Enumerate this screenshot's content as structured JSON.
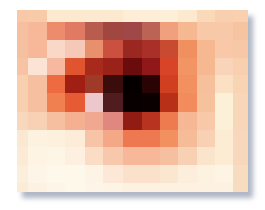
{
  "image": {
    "description": "Pixelated mosaic of an eye on a printed card with drop shadow",
    "grid": {
      "columns": 13,
      "rows": 11
    },
    "shadow_color": "#969eb2",
    "rows": [
      [
        "#f8c8a8",
        "#f7cba8",
        "#fde8d0",
        "#fde8d0",
        "#fde8d0",
        "#fde8d0",
        "#feeed8",
        "#feeed8",
        "#fdefd8",
        "#fde8d0",
        "#f9d9b8",
        "#f8d0b0",
        "#f9d0b0"
      ],
      [
        "#f6c0a0",
        "#f6b898",
        "#ec8c6c",
        "#e07a62",
        "#b85c50",
        "#a04840",
        "#a04848",
        "#bb6455",
        "#f0a07c",
        "#f5b890",
        "#f7c9a8",
        "#f7c9a8",
        "#f6c4a0"
      ],
      [
        "#f5c0a0",
        "#f6b898",
        "#fad8c8",
        "#f6c8b8",
        "#e8906c",
        "#cc5040",
        "#9a2820",
        "#a83028",
        "#c84a30",
        "#f09060",
        "#f5b890",
        "#f8c8a8",
        "#f7c8a8"
      ],
      [
        "#f6c4a4",
        "#fbe4d4",
        "#f7b8a0",
        "#e05530",
        "#a82a1c",
        "#9a2218",
        "#6a0c0c",
        "#901818",
        "#d84428",
        "#f29464",
        "#f6b890",
        "#fad4b8",
        "#f8d0b0"
      ],
      [
        "#f8d0b0",
        "#f6c0a0",
        "#ee6a40",
        "#a01e12",
        "#a03a28",
        "#3a0c0c",
        "#050000",
        "#2a0404",
        "#d04020",
        "#f29060",
        "#f6c09c",
        "#fbe0c4",
        "#f8d4b4"
      ],
      [
        "#f8d0b0",
        "#f6c0a0",
        "#f08050",
        "#e65a34",
        "#ecc8cc",
        "#501c20",
        "#080000",
        "#0a0000",
        "#b83018",
        "#f28c5c",
        "#f6c29e",
        "#fdf0d8",
        "#f8d6b8"
      ],
      [
        "#f8d8bc",
        "#f8d0b4",
        "#f6c0a0",
        "#f4b090",
        "#f0a890",
        "#e08880",
        "#901c14",
        "#b83420",
        "#ee7a50",
        "#f6b894",
        "#f8c8a8",
        "#fdf0d8",
        "#f8d6b8"
      ],
      [
        "#fbe8d0",
        "#fdf2e0",
        "#fdf0dc",
        "#fdecd8",
        "#f8c4a8",
        "#f4a888",
        "#ee7850",
        "#ee7850",
        "#f29060",
        "#f6bc98",
        "#f8d0b4",
        "#fcecd4",
        "#f8d8bc"
      ],
      [
        "#fbead4",
        "#fdf4e4",
        "#fdf6e6",
        "#fdf0e0",
        "#fbdcc4",
        "#f8c8ac",
        "#f6b898",
        "#f6b898",
        "#f6c0a0",
        "#f8d0b4",
        "#fbe4cc",
        "#fcecd4",
        "#f8d8bc"
      ],
      [
        "#fbeedc",
        "#fdf6e8",
        "#fdf8ea",
        "#fdf8ea",
        "#fdf4e6",
        "#fde8d8",
        "#fbe0cc",
        "#fbe0cc",
        "#fbe6d0",
        "#fdeedc",
        "#fdf2e0",
        "#fdf4e4",
        "#f8dcc0"
      ],
      [
        "#fbecd8",
        "#fdf2e2",
        "#fdf6e8",
        "#fdf8ea",
        "#fdf6e8",
        "#fdf4e6",
        "#fdf2e2",
        "#fdf2e2",
        "#fdf2e2",
        "#fdf2e2",
        "#fdf2e2",
        "#fdf2e2",
        "#f8dcc0"
      ]
    ]
  }
}
